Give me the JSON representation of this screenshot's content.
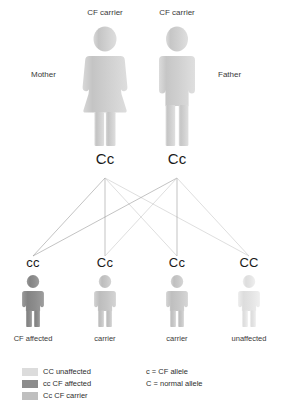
{
  "diagram": {
    "background": "#ffffff"
  },
  "parents": [
    {
      "role_label": "Mother",
      "status_label": "CF carrier",
      "genotype": "Cc",
      "figure": "female-figure-icon",
      "color": "#c9c9c9"
    },
    {
      "role_label": "Father",
      "status_label": "CF carrier",
      "genotype": "Cc",
      "figure": "male-figure-icon",
      "color": "#c9c9c9"
    }
  ],
  "children": [
    {
      "genotype": "cc",
      "caption": "CF affected",
      "figure": "child-figure-icon",
      "color": "#8c8c8c"
    },
    {
      "genotype": "Cc",
      "caption": "carrier",
      "figure": "child-figure-icon",
      "color": "#c2c2c2"
    },
    {
      "genotype": "Cc",
      "caption": "carrier",
      "figure": "child-figure-icon",
      "color": "#c2c2c2"
    },
    {
      "genotype": "CC",
      "caption": "unaffected",
      "figure": "child-figure-icon",
      "color": "#e2e2e2"
    }
  ],
  "legend": {
    "genotype_key": [
      {
        "swatch_color": "#dcdcdc",
        "label": "CC unaffected"
      },
      {
        "swatch_color": "#8c8c8c",
        "label": "cc CF affected"
      },
      {
        "swatch_color": "#bfbfbf",
        "label": "Cc CF carrier"
      }
    ],
    "allele_key": [
      "c = CF allele",
      "C = normal allele"
    ]
  }
}
